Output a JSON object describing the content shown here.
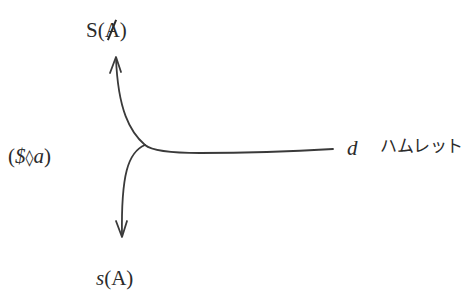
{
  "diagram": {
    "type": "lacanian-graph-schema",
    "labels": {
      "top": {
        "prefix": "S(",
        "symbol": "A",
        "suffix": ")",
        "symbol_barred": true
      },
      "bottom": {
        "prefix": "s",
        "rest": "(A)"
      },
      "left": {
        "open": "(",
        "subject": "$",
        "lozenge": "◊",
        "object": "a",
        "close": ")"
      },
      "right_var": "d",
      "right_text": "ハムレット"
    },
    "nodes": {
      "junction": {
        "x": 145,
        "y": 145
      },
      "top_arrow_tip": {
        "x": 116,
        "y": 57
      },
      "bottom_arrow_tip": {
        "x": 122,
        "y": 237
      },
      "line_end": {
        "x": 333,
        "y": 149
      }
    },
    "edges": [
      {
        "from": "junction",
        "to": "top_arrow_tip",
        "arrow": true,
        "target_label": "S(Ⱥ)"
      },
      {
        "from": "junction",
        "to": "bottom_arrow_tip",
        "arrow": true,
        "target_label": "s(A)"
      },
      {
        "from": "junction",
        "to": "line_end",
        "arrow": false,
        "target_label": "d ハムレット"
      }
    ],
    "stroke_color": "#3a3a3a",
    "text_color": "#2b2b2b"
  }
}
